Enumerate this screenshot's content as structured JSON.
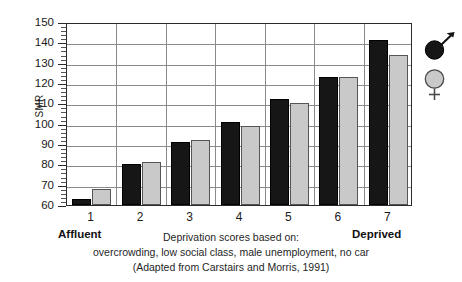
{
  "chart_data": {
    "type": "bar",
    "title": "",
    "xlabel": "",
    "ylabel": "SMR",
    "categories": [
      "1",
      "2",
      "3",
      "4",
      "5",
      "6",
      "7"
    ],
    "ylim": [
      60,
      150
    ],
    "ytick_values": [
      60,
      70,
      80,
      90,
      100,
      110,
      120,
      130,
      140,
      150
    ],
    "ytick_labels": [
      "60",
      "70",
      "80",
      "90",
      "100",
      "110",
      "120",
      "130",
      "140",
      "150"
    ],
    "minor_tick_step": 2,
    "grid": "horizontal-and-vertical",
    "legend_position": "right-outside",
    "series": [
      {
        "name": "Male",
        "symbol": "mars-symbol",
        "color": "#161616",
        "values": [
          63,
          80,
          91,
          101,
          112,
          123,
          141
        ]
      },
      {
        "name": "Female",
        "symbol": "venus-symbol",
        "color": "#c9c9c9",
        "values": [
          68,
          81,
          92,
          99,
          110,
          123,
          134
        ]
      }
    ],
    "annotations": {
      "x_low_end": "Affluent",
      "x_high_end": "Deprived"
    },
    "caption_lines": [
      "Deprivation scores based on:",
      "overcrowding, low social class, male unemployment, no car",
      "(Adapted from Carstairs and Morris, 1991)"
    ]
  }
}
